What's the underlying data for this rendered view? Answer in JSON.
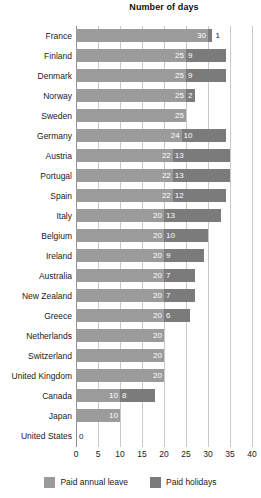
{
  "chart_data": {
    "type": "bar",
    "orientation": "horizontal",
    "stacked": true,
    "title": "Number of days",
    "xlabel": "",
    "ylabel": "",
    "xlim": [
      0,
      40
    ],
    "xticks": [
      0,
      5,
      10,
      15,
      20,
      25,
      30,
      35,
      40
    ],
    "xtick_labels": [
      "0",
      "5",
      "10",
      "15",
      "20",
      "25",
      "30",
      "35",
      "40"
    ],
    "grid": true,
    "legend_position": "bottom",
    "categories": [
      "France",
      "Finland",
      "Denmark",
      "Norway",
      "Sweden",
      "Germany",
      "Austria",
      "Portugal",
      "Spain",
      "Italy",
      "Belgium",
      "Ireland",
      "Australia",
      "New Zealand",
      "Greece",
      "Netherlands",
      "Switzerland",
      "United Kingdom",
      "Canada",
      "Japan",
      "United States"
    ],
    "series": [
      {
        "name": "Paid annual leave",
        "color": "#9b9b9b",
        "values": [
          30,
          25,
          25,
          25,
          25,
          24,
          22,
          22,
          22,
          20,
          20,
          20,
          20,
          20,
          20,
          20,
          20,
          20,
          10,
          10,
          0
        ]
      },
      {
        "name": "Paid holidays",
        "color": "#7b7b7b",
        "values": [
          1,
          9,
          9,
          2,
          0,
          10,
          13,
          13,
          12,
          13,
          10,
          9,
          7,
          7,
          6,
          0,
          0,
          0,
          8,
          0,
          0
        ]
      }
    ],
    "data_labels": [
      {
        "category": "France",
        "annual": "30",
        "holiday": "1",
        "annual_shown": true,
        "holiday_shown": true,
        "holiday_outside": true
      },
      {
        "category": "Finland",
        "annual": "25",
        "holiday": "9",
        "annual_shown": true,
        "holiday_shown": true,
        "holiday_outside": false
      },
      {
        "category": "Denmark",
        "annual": "25",
        "holiday": "9",
        "annual_shown": true,
        "holiday_shown": true,
        "holiday_outside": false
      },
      {
        "category": "Norway",
        "annual": "25",
        "holiday": "2",
        "annual_shown": true,
        "holiday_shown": true,
        "holiday_outside": false
      },
      {
        "category": "Sweden",
        "annual": "25",
        "holiday": "",
        "annual_shown": true,
        "holiday_shown": false,
        "holiday_outside": false
      },
      {
        "category": "Germany",
        "annual": "24",
        "holiday": "10",
        "annual_shown": true,
        "holiday_shown": true,
        "holiday_outside": false
      },
      {
        "category": "Austria",
        "annual": "22",
        "holiday": "13",
        "annual_shown": true,
        "holiday_shown": true,
        "holiday_outside": false
      },
      {
        "category": "Portugal",
        "annual": "22",
        "holiday": "13",
        "annual_shown": true,
        "holiday_shown": true,
        "holiday_outside": false
      },
      {
        "category": "Spain",
        "annual": "22",
        "holiday": "12",
        "annual_shown": true,
        "holiday_shown": true,
        "holiday_outside": false
      },
      {
        "category": "Italy",
        "annual": "20",
        "holiday": "13",
        "annual_shown": true,
        "holiday_shown": true,
        "holiday_outside": false
      },
      {
        "category": "Belgium",
        "annual": "20",
        "holiday": "10",
        "annual_shown": true,
        "holiday_shown": true,
        "holiday_outside": false
      },
      {
        "category": "Ireland",
        "annual": "20",
        "holiday": "9",
        "annual_shown": true,
        "holiday_shown": true,
        "holiday_outside": false
      },
      {
        "category": "Australia",
        "annual": "20",
        "holiday": "7",
        "annual_shown": true,
        "holiday_shown": true,
        "holiday_outside": false
      },
      {
        "category": "New Zealand",
        "annual": "20",
        "holiday": "7",
        "annual_shown": true,
        "holiday_shown": true,
        "holiday_outside": false
      },
      {
        "category": "Greece",
        "annual": "20",
        "holiday": "6",
        "annual_shown": true,
        "holiday_shown": true,
        "holiday_outside": false
      },
      {
        "category": "Netherlands",
        "annual": "20",
        "holiday": "",
        "annual_shown": true,
        "holiday_shown": false,
        "holiday_outside": false
      },
      {
        "category": "Switzerland",
        "annual": "20",
        "holiday": "",
        "annual_shown": true,
        "holiday_shown": false,
        "holiday_outside": false
      },
      {
        "category": "United Kingdom",
        "annual": "20",
        "holiday": "",
        "annual_shown": true,
        "holiday_shown": false,
        "holiday_outside": false
      },
      {
        "category": "Canada",
        "annual": "10",
        "holiday": "8",
        "annual_shown": true,
        "holiday_shown": true,
        "holiday_outside": false
      },
      {
        "category": "Japan",
        "annual": "10",
        "holiday": "",
        "annual_shown": true,
        "holiday_shown": false,
        "holiday_outside": false
      },
      {
        "category": "United States",
        "annual": "0",
        "holiday": "",
        "annual_shown": true,
        "holiday_shown": false,
        "holiday_outside": true
      }
    ]
  },
  "legend": {
    "items": [
      {
        "label": "Paid annual leave",
        "color": "#9b9b9b"
      },
      {
        "label": "Paid holidays",
        "color": "#7b7b7b"
      }
    ]
  },
  "colors": {
    "annual_leave": "#9b9b9b",
    "paid_holidays": "#7b7b7b",
    "gridline": "#c9c9c9",
    "axis": "#8f8f8f",
    "text": "#1a1a1a",
    "label_on_bar": "#ffffff",
    "background": "#ffffff"
  }
}
